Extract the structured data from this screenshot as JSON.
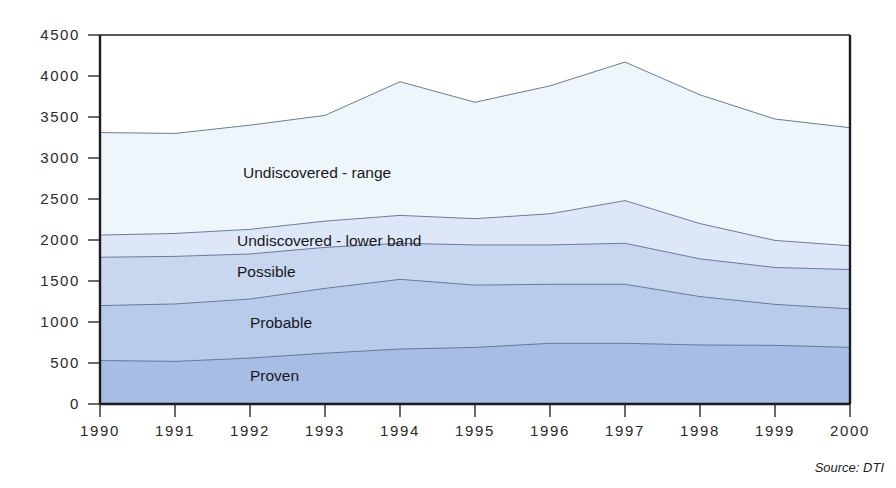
{
  "chart_data": {
    "type": "area",
    "stacked": true,
    "title": "",
    "subtitle": "",
    "xlabel": "",
    "ylabel": "",
    "categories": [
      "1990",
      "1991",
      "1992",
      "1993",
      "1994",
      "1995",
      "1996",
      "1997",
      "1998",
      "1999",
      "2000"
    ],
    "x": [
      1990,
      1991,
      1992,
      1993,
      1994,
      1995,
      1996,
      1997,
      1998,
      1999,
      2000
    ],
    "ylim": [
      0,
      4500
    ],
    "xlim": [
      1990,
      2000
    ],
    "ytick_labels": [
      "0",
      "500",
      "1000",
      "1500",
      "2000",
      "2500",
      "3000",
      "3500",
      "4000",
      "4500"
    ],
    "ytick_values": [
      0,
      500,
      1000,
      1500,
      2000,
      2500,
      3000,
      3500,
      4000,
      4500
    ],
    "ytick_step": 500,
    "grid": false,
    "legend": "inline-labels",
    "legend_position": "inside-bands",
    "annotations": [
      "Source: DTI"
    ],
    "source": "Source: DTI",
    "series": [
      {
        "name": "Proven",
        "label": "Proven",
        "color": "#a7bde4",
        "values": [
          530,
          520,
          560,
          620,
          670,
          690,
          740,
          740,
          720,
          715,
          690
        ]
      },
      {
        "name": "Probable",
        "label": "Probable",
        "color": "#b9cbeb",
        "values": [
          670,
          700,
          720,
          790,
          850,
          760,
          720,
          720,
          590,
          500,
          470
        ]
      },
      {
        "name": "Possible",
        "label": "Possible",
        "color": "#c8d6ef",
        "values": [
          590,
          580,
          550,
          500,
          440,
          490,
          480,
          500,
          460,
          450,
          480
        ]
      },
      {
        "name": "Undiscovered - lower band",
        "label": "Undiscovered - lower band",
        "color": "#dde7f7",
        "values": [
          270,
          280,
          300,
          320,
          340,
          320,
          380,
          520,
          430,
          330,
          290
        ]
      },
      {
        "name": "Undiscovered - range",
        "label": "Undiscovered - range",
        "color": "#eef5fb",
        "values": [
          1250,
          1220,
          1270,
          1290,
          1630,
          1420,
          1560,
          1690,
          1570,
          1480,
          1440
        ]
      }
    ],
    "cumulative_tops": {
      "Proven": [
        530,
        520,
        560,
        620,
        670,
        690,
        740,
        740,
        720,
        715,
        690
      ],
      "Probable": [
        1200,
        1220,
        1280,
        1410,
        1520,
        1450,
        1460,
        1460,
        1310,
        1215,
        1160
      ],
      "Possible": [
        1790,
        1800,
        1830,
        1910,
        1960,
        1940,
        1940,
        1960,
        1770,
        1665,
        1640
      ],
      "Undiscovered - lower band": [
        2060,
        2080,
        2130,
        2230,
        2300,
        2260,
        2320,
        2480,
        2200,
        1995,
        1930
      ],
      "Undiscovered - range": [
        3310,
        3300,
        3400,
        3520,
        3930,
        3680,
        3880,
        4170,
        3770,
        3475,
        3370
      ]
    },
    "totals": [
      3310,
      3300,
      3400,
      3520,
      3930,
      3680,
      3880,
      4170,
      3770,
      3475,
      3370
    ]
  },
  "axes": {
    "y": {
      "ticks": [
        {
          "label": "4500",
          "value": 4500
        },
        {
          "label": "4000",
          "value": 4000
        },
        {
          "label": "3500",
          "value": 3500
        },
        {
          "label": "3000",
          "value": 3000
        },
        {
          "label": "2500",
          "value": 2500
        },
        {
          "label": "2000",
          "value": 2000
        },
        {
          "label": "1500",
          "value": 1500
        },
        {
          "label": "1000",
          "value": 1000
        },
        {
          "label": "500",
          "value": 500
        },
        {
          "label": "0",
          "value": 0
        }
      ]
    },
    "x": {
      "ticks": [
        "1990",
        "1991",
        "1992",
        "1993",
        "1994",
        "1995",
        "1996",
        "1997",
        "1998",
        "1999",
        "2000"
      ]
    }
  },
  "labels": {
    "undiscovered_range": "Undiscovered - range",
    "undiscovered_lower_band": "Undiscovered - lower band",
    "possible": "Possible",
    "probable": "Probable",
    "proven": "Proven"
  },
  "footer": {
    "source": "Source: DTI"
  },
  "colors": {
    "proven": "#a7bde4",
    "probable": "#b9cbeb",
    "possible": "#c8d6ef",
    "undiscovered_lower_band": "#dde7f7",
    "undiscovered_range": "#eef5fb",
    "axis": "#1b1b22",
    "band_edge": "#5f6f8e",
    "text": "#1d1d1d",
    "background": "#ffffff"
  }
}
